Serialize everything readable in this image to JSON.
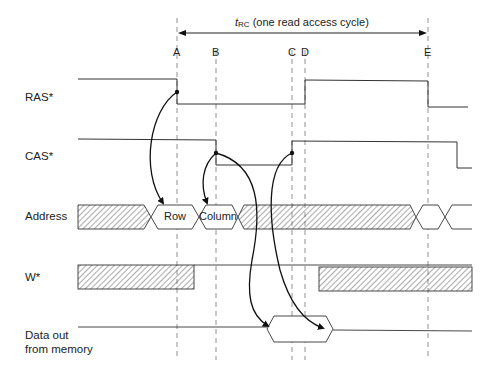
{
  "diagram": {
    "title": {
      "symbol": "t",
      "subscript": "RC",
      "text": " (one read access cycle)"
    },
    "time_markers": [
      {
        "label": "A",
        "x": 177
      },
      {
        "label": "B",
        "x": 216
      },
      {
        "label": "C",
        "x": 292
      },
      {
        "label": "D",
        "x": 305
      },
      {
        "label": "E",
        "x": 428
      }
    ],
    "signals": [
      {
        "name": "RAS*"
      },
      {
        "name": "CAS*"
      },
      {
        "name": "Address"
      },
      {
        "name": "W*"
      },
      {
        "name": "Data out",
        "name_line2": "from memory"
      }
    ],
    "address_values": {
      "row": "Row",
      "column": "Column"
    },
    "causal_arrows": [
      {
        "from": "RAS* falling edge (A)",
        "to": "Row address"
      },
      {
        "from": "CAS* falling edge (B)",
        "to": "Column address"
      },
      {
        "from": "CAS* falling edge (B)",
        "to": "Data out valid start"
      },
      {
        "from": "CAS* rising edge (C)",
        "to": "Data out valid end"
      }
    ],
    "colors": {
      "line": "#333333",
      "dashed": "#777777",
      "hatch": "#555555"
    }
  }
}
